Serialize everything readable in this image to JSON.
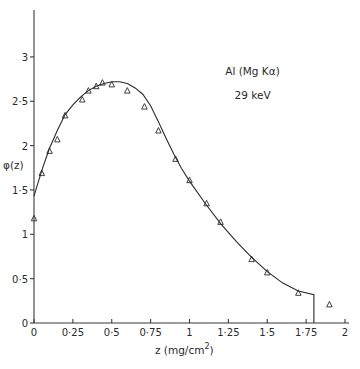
{
  "chart_data": {
    "type": "line",
    "title": "",
    "xlabel": "z  (mg/cm",
    "xlabel_superscript": "2",
    "xlabel_close": ")",
    "ylabel": "φ(z)",
    "xlim": [
      0,
      2
    ],
    "ylim": [
      0,
      3.4
    ],
    "grid": false,
    "legend": null,
    "annotations": [
      {
        "text": "Al (Mg Kα)",
        "x": 1.23,
        "y": 2.8
      },
      {
        "text": "29 keV",
        "x": 1.29,
        "y": 2.53
      }
    ],
    "x_ticks": [
      {
        "value": 0,
        "label": "0"
      },
      {
        "value": 0.25,
        "label": "0·25"
      },
      {
        "value": 0.5,
        "label": "0·5"
      },
      {
        "value": 0.75,
        "label": "0·75"
      },
      {
        "value": 1,
        "label": "1"
      },
      {
        "value": 1.25,
        "label": "1·25"
      },
      {
        "value": 1.5,
        "label": "1·5"
      },
      {
        "value": 1.75,
        "label": "1·75"
      },
      {
        "value": 2,
        "label": "2"
      }
    ],
    "y_ticks": [
      {
        "value": 0,
        "label": "0"
      },
      {
        "value": 0.5,
        "label": "0·5"
      },
      {
        "value": 1,
        "label": "1"
      },
      {
        "value": 1.5,
        "label": "1·5"
      },
      {
        "value": 2,
        "label": "2"
      },
      {
        "value": 2.5,
        "label": "2·5"
      },
      {
        "value": 3,
        "label": "3"
      }
    ],
    "series": [
      {
        "name": "calculated curve",
        "style": "line",
        "x": [
          0,
          0.05,
          0.1,
          0.15,
          0.2,
          0.25,
          0.3,
          0.35,
          0.4,
          0.45,
          0.5,
          0.55,
          0.6,
          0.65,
          0.7,
          0.75,
          0.8,
          0.85,
          0.9,
          0.95,
          1.0,
          1.1,
          1.2,
          1.3,
          1.4,
          1.5,
          1.6,
          1.7,
          1.8,
          1.8
        ],
        "y": [
          1.43,
          1.72,
          1.97,
          2.17,
          2.35,
          2.46,
          2.55,
          2.62,
          2.67,
          2.7,
          2.72,
          2.72,
          2.7,
          2.65,
          2.58,
          2.45,
          2.27,
          2.08,
          1.9,
          1.74,
          1.6,
          1.35,
          1.12,
          0.92,
          0.74,
          0.58,
          0.45,
          0.36,
          0.32,
          0
        ]
      },
      {
        "name": "experimental data",
        "style": "triangle-markers",
        "x": [
          0.0,
          0.05,
          0.1,
          0.15,
          0.2,
          0.31,
          0.35,
          0.4,
          0.44,
          0.5,
          0.6,
          0.71,
          0.8,
          0.91,
          1.0,
          1.11,
          1.2,
          1.4,
          1.5,
          1.7,
          1.9
        ],
        "y": [
          1.18,
          1.69,
          1.94,
          2.07,
          2.34,
          2.52,
          2.62,
          2.67,
          2.71,
          2.69,
          2.62,
          2.44,
          2.17,
          1.85,
          1.61,
          1.35,
          1.14,
          0.72,
          0.57,
          0.34,
          0.21
        ]
      }
    ]
  }
}
